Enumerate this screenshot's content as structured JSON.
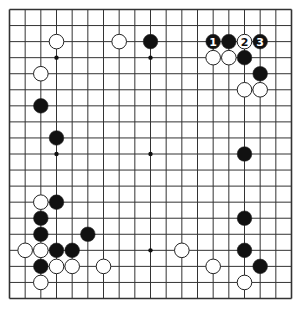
{
  "diagram": {
    "type": "go-board",
    "size": 19,
    "colors": {
      "background": "#ffffff",
      "line": "#333333",
      "black_stone": "#111111",
      "white_stone": "#ffffff",
      "stone_outline": "#222222"
    },
    "star_points": [
      [
        3,
        3
      ],
      [
        9,
        3
      ],
      [
        15,
        3
      ],
      [
        3,
        9
      ],
      [
        9,
        9
      ],
      [
        15,
        9
      ],
      [
        3,
        15
      ],
      [
        9,
        15
      ],
      [
        15,
        15
      ]
    ],
    "stones": [
      {
        "col": 3,
        "row": 2,
        "color": "white"
      },
      {
        "col": 7,
        "row": 2,
        "color": "white"
      },
      {
        "col": 9,
        "row": 2,
        "color": "black"
      },
      {
        "col": 13,
        "row": 2,
        "color": "black",
        "label": "1"
      },
      {
        "col": 14,
        "row": 2,
        "color": "black"
      },
      {
        "col": 15,
        "row": 2,
        "color": "white",
        "label": "2"
      },
      {
        "col": 16,
        "row": 2,
        "color": "black",
        "label": "3"
      },
      {
        "col": 13,
        "row": 3,
        "color": "white"
      },
      {
        "col": 14,
        "row": 3,
        "color": "white"
      },
      {
        "col": 15,
        "row": 3,
        "color": "black"
      },
      {
        "col": 2,
        "row": 4,
        "color": "white"
      },
      {
        "col": 16,
        "row": 4,
        "color": "black"
      },
      {
        "col": 15,
        "row": 5,
        "color": "white"
      },
      {
        "col": 16,
        "row": 5,
        "color": "white"
      },
      {
        "col": 2,
        "row": 6,
        "color": "black"
      },
      {
        "col": 3,
        "row": 8,
        "color": "black"
      },
      {
        "col": 15,
        "row": 9,
        "color": "black"
      },
      {
        "col": 2,
        "row": 12,
        "color": "white"
      },
      {
        "col": 3,
        "row": 12,
        "color": "black"
      },
      {
        "col": 2,
        "row": 13,
        "color": "black"
      },
      {
        "col": 15,
        "row": 13,
        "color": "black"
      },
      {
        "col": 2,
        "row": 14,
        "color": "black"
      },
      {
        "col": 5,
        "row": 14,
        "color": "black"
      },
      {
        "col": 1,
        "row": 15,
        "color": "white"
      },
      {
        "col": 2,
        "row": 15,
        "color": "white"
      },
      {
        "col": 3,
        "row": 15,
        "color": "black"
      },
      {
        "col": 4,
        "row": 15,
        "color": "black"
      },
      {
        "col": 11,
        "row": 15,
        "color": "white"
      },
      {
        "col": 15,
        "row": 15,
        "color": "black"
      },
      {
        "col": 2,
        "row": 16,
        "color": "black"
      },
      {
        "col": 3,
        "row": 16,
        "color": "white"
      },
      {
        "col": 4,
        "row": 16,
        "color": "white"
      },
      {
        "col": 6,
        "row": 16,
        "color": "white"
      },
      {
        "col": 13,
        "row": 16,
        "color": "white"
      },
      {
        "col": 16,
        "row": 16,
        "color": "black"
      },
      {
        "col": 2,
        "row": 17,
        "color": "white"
      },
      {
        "col": 15,
        "row": 17,
        "color": "white"
      }
    ],
    "move_labels": [
      "1",
      "2",
      "3"
    ]
  }
}
